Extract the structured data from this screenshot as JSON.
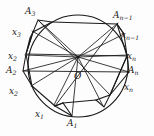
{
  "figure": {
    "name": "inscribed-polygon-in-circle",
    "colors": {
      "stroke": "#1a1a1a",
      "background": "#fdfdfd",
      "label": "#1a1a1a"
    },
    "center_label": "O",
    "vertex_labels": [
      {
        "id": "A1",
        "base": "A",
        "sub": "1"
      },
      {
        "id": "A2",
        "base": "A",
        "sub": "2"
      },
      {
        "id": "A3",
        "base": "A",
        "sub": "3"
      },
      {
        "id": "An1",
        "base": "A",
        "sub": "n−1"
      },
      {
        "id": "An",
        "base": "A",
        "sub": "n"
      }
    ],
    "side_labels": [
      {
        "id": "x1",
        "base": "x",
        "sub": "1"
      },
      {
        "id": "x2_top",
        "base": "x",
        "sub": "2"
      },
      {
        "id": "x2_bottom",
        "base": "x",
        "sub": "2"
      },
      {
        "id": "x3",
        "base": "x",
        "sub": "3"
      },
      {
        "id": "xn_top",
        "base": "x",
        "sub": "n"
      },
      {
        "id": "xn_bottom",
        "base": "x",
        "sub": "n"
      },
      {
        "id": "xn1",
        "base": "x",
        "sub": "n−1"
      }
    ]
  }
}
